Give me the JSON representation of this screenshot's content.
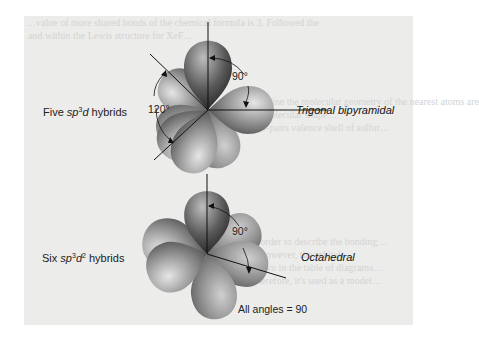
{
  "figure": {
    "top": {
      "label_prefix": "Five ",
      "label_sp": "sp",
      "label_sup": "3",
      "label_d": "d",
      "label_suffix": " hybrids",
      "geometry": "Trigonal bipyramidal",
      "angle_axial": "90°",
      "angle_equatorial": "120°"
    },
    "bottom": {
      "label_prefix": "Six ",
      "label_sp": "sp",
      "label_sup": "3",
      "label_d": "d",
      "label_sup2": "2",
      "label_suffix": " hybrids",
      "geometry": "Octahedral",
      "angle": "90°",
      "note": "All angles = 90"
    }
  },
  "background_text": {
    "line1": "…value of more shared bonds of the chemical formula is 3. Followed the",
    "line2": "and within the Lewis structure for XeF…",
    "line3": "…we determine the molecular geometry of the nearest atoms are",
    "line4": "…that the molecular shape…",
    "line5": "…electrons-pairs valence shell of sulfur…",
    "line6": "…in order to describe the bonding…",
    "line7": "…of however, the orbitals…",
    "line8": "…shown in the table of diagrams…",
    "line9": "…Therefore, it's used as a model…"
  },
  "colors": {
    "panel": "#ececea",
    "lobe_dark": "#2a2a2a",
    "lobe_mid": "#7a7a7a",
    "lobe_light": "#d9d9d9",
    "axis": "#111111"
  }
}
